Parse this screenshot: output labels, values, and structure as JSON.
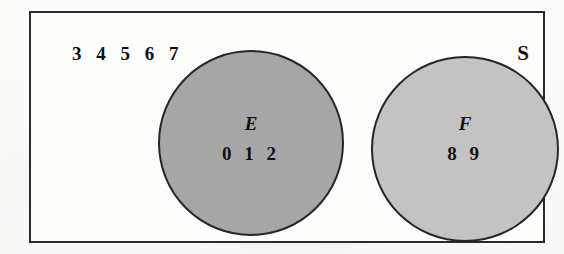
{
  "diagram": {
    "type": "venn",
    "universal_set": {
      "label": "S",
      "border_color": "#2a2a2a",
      "fill_color": "#fdfdfc",
      "elements_outside_circles": "3 4 5 6 7"
    },
    "sets": [
      {
        "name": "E",
        "elements": "0 1 2",
        "fill_color": "#a6a6a6",
        "border_color": "#262626",
        "position": "left"
      },
      {
        "name": "F",
        "elements": "8 9",
        "fill_color": "#c3c3c3",
        "border_color": "#262626",
        "position": "right"
      }
    ],
    "overlap": "none"
  }
}
